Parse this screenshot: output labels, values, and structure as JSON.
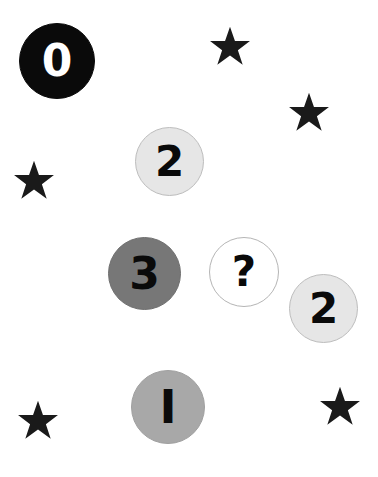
{
  "scene": {
    "width": 378,
    "height": 477,
    "background_color": "#ffffff",
    "description": "Grayscale shade-number matching puzzle: numbered circles of varying gray values plus black five-pointed stars on a white field"
  },
  "tokens": [
    {
      "id": "circle-0",
      "label": "0",
      "icon_name": "numbered-circle-0",
      "fill_color": "#0a0a0a",
      "border_color": "#0a0a0a",
      "text_color": "#ffffff",
      "x": 19,
      "y": 23,
      "size": 76,
      "font_size": 44
    },
    {
      "id": "circle-2-top",
      "label": "2",
      "icon_name": "numbered-circle-2-top",
      "fill_color": "#e6e6e6",
      "border_color": "#bdbdbd",
      "text_color": "#0a0a0a",
      "x": 135,
      "y": 127,
      "size": 69,
      "font_size": 42
    },
    {
      "id": "circle-3",
      "label": "3",
      "icon_name": "numbered-circle-3",
      "fill_color": "#777777",
      "border_color": "#6f6f6f",
      "text_color": "#0a0a0a",
      "x": 108,
      "y": 237,
      "size": 73,
      "font_size": 44
    },
    {
      "id": "circle-question",
      "label": "?",
      "icon_name": "numbered-circle-unknown",
      "fill_color": "#ffffff",
      "border_color": "#b5b5b5",
      "text_color": "#0a0a0a",
      "x": 209,
      "y": 237,
      "size": 70,
      "font_size": 42
    },
    {
      "id": "circle-2-right",
      "label": "2",
      "icon_name": "numbered-circle-2-right",
      "fill_color": "#e6e6e6",
      "border_color": "#bdbdbd",
      "text_color": "#0a0a0a",
      "x": 289,
      "y": 274,
      "size": 69,
      "font_size": 42
    },
    {
      "id": "circle-1",
      "label": "I",
      "icon_name": "numbered-circle-1",
      "fill_color": "#a8a8a8",
      "border_color": "#a0a0a0",
      "text_color": "#0a0a0a",
      "x": 131,
      "y": 370,
      "size": 74,
      "font_size": 46
    }
  ],
  "stars": [
    {
      "id": "star-top-center",
      "icon_name": "star-icon",
      "color": "#1a1a1a",
      "x": 209,
      "y": 26,
      "size": 42
    },
    {
      "id": "star-top-right",
      "icon_name": "star-icon",
      "color": "#1a1a1a",
      "x": 288,
      "y": 92,
      "size": 42
    },
    {
      "id": "star-left-upper",
      "icon_name": "star-icon",
      "color": "#1a1a1a",
      "x": 13,
      "y": 160,
      "size": 42
    },
    {
      "id": "star-bottom-left",
      "icon_name": "star-icon",
      "color": "#1a1a1a",
      "x": 17,
      "y": 400,
      "size": 42
    },
    {
      "id": "star-bottom-right",
      "icon_name": "star-icon",
      "color": "#1a1a1a",
      "x": 319,
      "y": 386,
      "size": 42
    }
  ],
  "chart_data": {
    "type": "scatter",
    "title": "",
    "xlabel": "",
    "ylabel": "",
    "xlim": [
      0,
      378
    ],
    "ylim": [
      0,
      477
    ],
    "grid": false,
    "legend_position": "none",
    "series": [
      {
        "name": "numbered circles",
        "points": [
          {
            "label": "0",
            "x": 57,
            "y": 61,
            "shade": "#0a0a0a",
            "diameter": 76
          },
          {
            "label": "2",
            "x": 169,
            "y": 161,
            "shade": "#e6e6e6",
            "diameter": 69
          },
          {
            "label": "3",
            "x": 144,
            "y": 273,
            "shade": "#777777",
            "diameter": 73
          },
          {
            "label": "?",
            "x": 244,
            "y": 272,
            "shade": "#ffffff",
            "diameter": 70
          },
          {
            "label": "2",
            "x": 323,
            "y": 308,
            "shade": "#e6e6e6",
            "diameter": 69
          },
          {
            "label": "1",
            "x": 168,
            "y": 407,
            "shade": "#a8a8a8",
            "diameter": 74
          }
        ]
      },
      {
        "name": "stars",
        "points": [
          {
            "label": "star",
            "x": 230,
            "y": 47,
            "shade": "#1a1a1a",
            "diameter": 42
          },
          {
            "label": "star",
            "x": 309,
            "y": 113,
            "shade": "#1a1a1a",
            "diameter": 42
          },
          {
            "label": "star",
            "x": 34,
            "y": 181,
            "shade": "#1a1a1a",
            "diameter": 42
          },
          {
            "label": "star",
            "x": 38,
            "y": 421,
            "shade": "#1a1a1a",
            "diameter": 42
          },
          {
            "label": "star",
            "x": 340,
            "y": 407,
            "shade": "#1a1a1a",
            "diameter": 42
          }
        ]
      }
    ]
  }
}
